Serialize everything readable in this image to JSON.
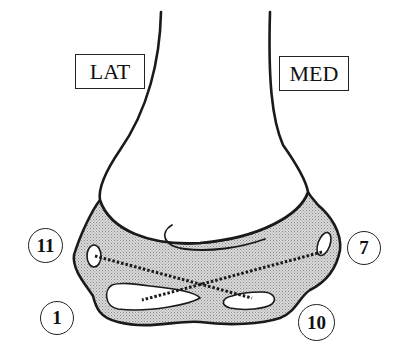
{
  "diagram": {
    "type": "anatomical-schematic",
    "labels": {
      "lateral": "LAT",
      "medial": "MED"
    },
    "markers": [
      {
        "id": "11",
        "label": "11",
        "side": "lateral",
        "position": "upper"
      },
      {
        "id": "1",
        "label": "1",
        "side": "lateral",
        "position": "lower"
      },
      {
        "id": "7",
        "label": "7",
        "side": "medial",
        "position": "upper"
      },
      {
        "id": "10",
        "label": "10",
        "side": "medial",
        "position": "lower"
      }
    ],
    "connections": [
      {
        "from": "11",
        "to": "10",
        "style": "dotted"
      },
      {
        "from": "7",
        "to": "1",
        "style": "dotted"
      }
    ],
    "colors": {
      "outline": "#1a1a1a",
      "shaded_region": "#cfcfcf",
      "background": "#ffffff"
    }
  }
}
